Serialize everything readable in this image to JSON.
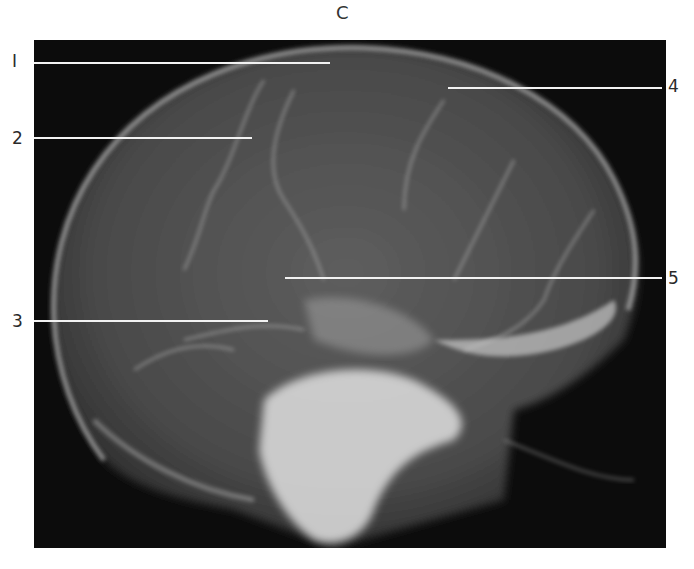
{
  "figure": {
    "panel_letter": "C",
    "labels": [
      {
        "id": "1",
        "text": "I",
        "x": 12,
        "y": 53,
        "line": {
          "x1": 34,
          "y1": 63,
          "x2": 330,
          "y2": 63
        }
      },
      {
        "id": "2",
        "text": "2",
        "x": 12,
        "y": 130,
        "line": {
          "x1": 34,
          "y1": 138,
          "x2": 252,
          "y2": 138
        }
      },
      {
        "id": "3",
        "text": "3",
        "x": 12,
        "y": 313,
        "line": {
          "x1": 34,
          "y1": 321,
          "x2": 268,
          "y2": 321
        }
      },
      {
        "id": "4",
        "text": "4",
        "x": 668,
        "y": 78,
        "line": {
          "x1": 448,
          "y1": 88,
          "x2": 662,
          "y2": 88
        }
      },
      {
        "id": "5",
        "text": "5",
        "x": 668,
        "y": 270,
        "line": {
          "x1": 285,
          "y1": 278,
          "x2": 662,
          "y2": 278
        }
      }
    ]
  }
}
